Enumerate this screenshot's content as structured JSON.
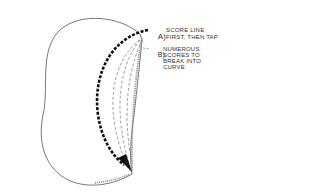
{
  "diagram": {
    "labels": {
      "a_marker": "A)",
      "a_line1": "Score line",
      "a_line2": "first, then tap",
      "b_marker": "B)",
      "b_line1": "Numerous",
      "b_line2": "scores to",
      "b_line3": "break into",
      "b_line4": "curve"
    },
    "colors": {
      "outline": "#555555",
      "bold_score": "#111111",
      "dashed_score": "#777777"
    }
  }
}
